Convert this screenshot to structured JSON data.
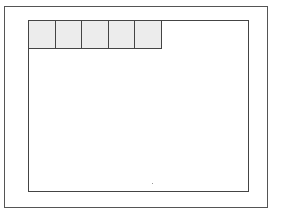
{
  "diagram": {
    "outer_frame": {
      "stroke": "#555555"
    },
    "inner_frame": {
      "stroke": "#444444",
      "fill": "#ffffff"
    },
    "header_cells": {
      "count": 5,
      "fill": "#ececec",
      "stroke": "#444444",
      "labels": [
        "",
        "",
        "",
        "",
        ""
      ]
    }
  }
}
